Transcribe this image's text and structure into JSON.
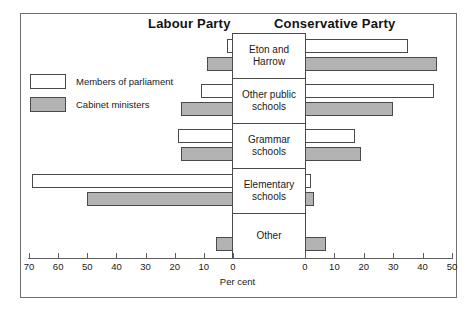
{
  "headers": {
    "left_party": "Labour Party",
    "right_party": "Conservative Party"
  },
  "legend": {
    "items": [
      {
        "label": "Members of parliament",
        "swatch": "white-box-icon",
        "key": "mp"
      },
      {
        "label": "Cabinet ministers",
        "swatch": "grey-box-icon",
        "key": "cab"
      }
    ]
  },
  "axis": {
    "caption": "Per cent",
    "left_ticks": [
      70,
      60,
      50,
      40,
      30,
      20,
      10,
      0
    ],
    "right_ticks": [
      0,
      10,
      20,
      30,
      40,
      50
    ],
    "left_max": 70,
    "right_max": 50
  },
  "chart_data": {
    "type": "bar",
    "orientation": "horizontal-bidirectional",
    "xlabel": "Per cent",
    "ylabel": "",
    "grid": false,
    "legend_position": "left",
    "categories": [
      "Eton and Harrow",
      "Other public schools",
      "Grammar schools",
      "Elementary schools",
      "Other"
    ],
    "panels": [
      {
        "name": "Labour Party",
        "side": "left",
        "axis_range": [
          0,
          70
        ],
        "axis_direction": "right-to-left",
        "series": [
          {
            "name": "Members of parliament",
            "values": [
              2,
              11,
              19,
              69,
              0
            ]
          },
          {
            "name": "Cabinet ministers",
            "values": [
              9,
              18,
              18,
              50,
              6
            ]
          }
        ]
      },
      {
        "name": "Conservative Party",
        "side": "right",
        "axis_range": [
          0,
          50
        ],
        "axis_direction": "left-to-right",
        "series": [
          {
            "name": "Members of parliament",
            "values": [
              35,
              44,
              17,
              2,
              0
            ]
          },
          {
            "name": "Cabinet ministers",
            "values": [
              45,
              30,
              19,
              3,
              7
            ]
          }
        ]
      }
    ]
  }
}
